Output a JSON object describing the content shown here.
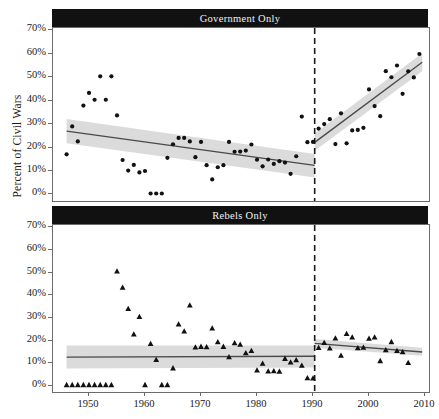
{
  "figure": {
    "ylabel": "Percent of Civil Wars",
    "background": "#ffffff",
    "panel_header_bg": "#111111",
    "panel_header_fg": "#f2f2f2",
    "point_color": "#111111",
    "trend_color": "#4a4a4a",
    "ci_color": "#cfcfcf",
    "axis_color": "#6b6b6b",
    "breakline_color": "#1a1a1a"
  },
  "panels": [
    {
      "key": "government_only",
      "title": "Government Only",
      "marker": "circle"
    },
    {
      "key": "rebels_only",
      "title": "Rebels Only",
      "marker": "triangle"
    }
  ],
  "axes": {
    "y_ticks": [
      "0%",
      "10%",
      "20%",
      "30%",
      "40%",
      "50%",
      "60%",
      "70%"
    ],
    "y_values": [
      0,
      10,
      20,
      30,
      40,
      50,
      60,
      70
    ],
    "x_ticks": [
      "1950",
      "1960",
      "1970",
      "1980",
      "1990",
      "2000",
      "2010"
    ],
    "x_values": [
      1950,
      1960,
      1970,
      1980,
      1990,
      2000,
      2010
    ],
    "xlim": [
      1944.5,
      2011.5
    ],
    "ylim": [
      -4,
      75
    ],
    "grid": false,
    "break_year": 1990.3,
    "break_label": "1990"
  },
  "chart_data": {
    "type": "scatter",
    "title": "",
    "subtitle": "",
    "xlabel": "",
    "ylabel": "Percent of Civil Wars",
    "xlim": [
      1944.5,
      2011.5
    ],
    "ylim": [
      -4,
      75
    ],
    "grid": false,
    "legend": "none",
    "annotations": [
      {
        "type": "vline",
        "x": 1990.3,
        "style": "dashed",
        "label": "1990 structural break"
      }
    ],
    "panels": [
      {
        "name": "Government Only",
        "marker": "circle",
        "x": [
          1946,
          1947,
          1948,
          1949,
          1950,
          1951,
          1952,
          1953,
          1954,
          1955,
          1956,
          1957,
          1958,
          1959,
          1960,
          1961,
          1962,
          1963,
          1964,
          1965,
          1966,
          1967,
          1968,
          1969,
          1970,
          1971,
          1972,
          1973,
          1974,
          1975,
          1976,
          1977,
          1978,
          1979,
          1980,
          1981,
          1982,
          1983,
          1984,
          1985,
          1986,
          1987,
          1988,
          1989,
          1990,
          1991,
          1992,
          1993,
          1994,
          1995,
          1996,
          1997,
          1998,
          1999,
          2000,
          2001,
          2002,
          2003,
          2004,
          2005,
          2006,
          2007,
          2008,
          2009
        ],
        "y": [
          16.7,
          28.6,
          22.2,
          37.5,
          42.9,
          40.0,
          50.0,
          40.0,
          50.0,
          33.3,
          14.3,
          9.8,
          12.2,
          9.0,
          9.6,
          0.0,
          0.0,
          0.0,
          15.2,
          21.0,
          23.7,
          23.7,
          22.2,
          15.5,
          22.0,
          12.1,
          6.0,
          11.2,
          12.1,
          22.0,
          17.8,
          17.9,
          18.3,
          20.9,
          14.4,
          11.6,
          14.5,
          12.6,
          13.8,
          13.2,
          8.4,
          15.9,
          32.8,
          21.9,
          22.0,
          27.7,
          29.6,
          31.7,
          21.1,
          34.2,
          21.4,
          26.9,
          27.1,
          28.0,
          44.4,
          37.3,
          33.0,
          52.2,
          49.6,
          54.6,
          42.5,
          52.1,
          49.5,
          59.5
        ],
        "trend_pre": {
          "x": [
            1946,
            1990.3
          ],
          "y": [
            26.6,
            12.0
          ]
        },
        "trend_post": {
          "x": [
            1990.3,
            2009.5
          ],
          "y": [
            21.8,
            56.0
          ]
        },
        "ci_pre": {
          "upper": [
            31.8,
            16.8
          ],
          "lower": [
            21.4,
            6.8
          ]
        },
        "ci_post": {
          "upper": [
            25.6,
            59.8
          ],
          "lower": [
            18.2,
            52.2
          ]
        }
      },
      {
        "name": "Rebels Only",
        "marker": "triangle",
        "x": [
          1946,
          1947,
          1948,
          1949,
          1950,
          1951,
          1952,
          1953,
          1954,
          1955,
          1956,
          1957,
          1958,
          1959,
          1960,
          1961,
          1962,
          1963,
          1964,
          1965,
          1966,
          1967,
          1968,
          1969,
          1970,
          1971,
          1972,
          1973,
          1974,
          1975,
          1976,
          1977,
          1978,
          1979,
          1980,
          1981,
          1982,
          1983,
          1984,
          1985,
          1986,
          1987,
          1988,
          1989,
          1990,
          1991,
          1992,
          1993,
          1994,
          1995,
          1996,
          1997,
          1998,
          1999,
          2000,
          2001,
          2002,
          2003,
          2004,
          2005,
          2006,
          2007,
          2008,
          2009
        ],
        "y": [
          0.0,
          0.0,
          0.0,
          0.0,
          0.0,
          0.0,
          0.0,
          0.0,
          0.0,
          50.2,
          43.0,
          33.6,
          22.4,
          30.1,
          0.0,
          18.2,
          11.1,
          0.0,
          0.0,
          7.4,
          26.8,
          23.7,
          35.2,
          16.6,
          16.9,
          16.7,
          25.0,
          18.9,
          16.9,
          12.3,
          18.5,
          17.8,
          14.1,
          15.1,
          6.5,
          9.4,
          6.0,
          6.1,
          5.9,
          11.6,
          10.0,
          11.0,
          8.6,
          3.0,
          2.9,
          16.4,
          18.6,
          16.2,
          20.6,
          13.0,
          22.6,
          21.0,
          16.3,
          16.5,
          20.5,
          21.0,
          10.6,
          15.4,
          19.0,
          15.1,
          14.5,
          9.8
        ],
        "trend_pre": {
          "x": [
            1946,
            1990.3
          ],
          "y": [
            12.2,
            12.6
          ]
        },
        "trend_post": {
          "x": [
            1990.3,
            2009.5
          ],
          "y": [
            18.3,
            14.5
          ]
        },
        "ci_pre": {
          "upper": [
            17.3,
            17.4
          ],
          "lower": [
            7.2,
            7.6
          ]
        },
        "ci_post": {
          "upper": [
            20.2,
            16.3
          ],
          "lower": [
            16.4,
            12.8
          ]
        }
      }
    ]
  }
}
